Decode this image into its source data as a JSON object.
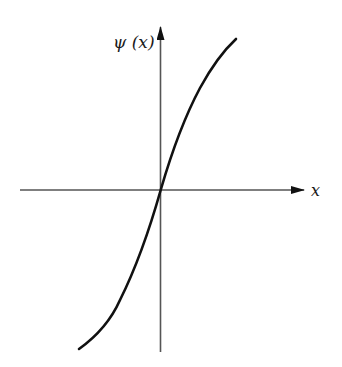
{
  "diagram": {
    "type": "function-plot",
    "y_axis_label": "ψ (x)",
    "x_axis_label": "x",
    "curve": "odd monotonic S-shaped function passing through origin",
    "colors": {
      "axis": "#555555",
      "curve": "#111111",
      "background": "#ffffff"
    }
  }
}
